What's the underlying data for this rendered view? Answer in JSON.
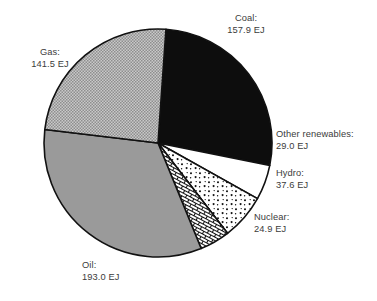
{
  "chart_data": {
    "type": "pie",
    "title": "",
    "unit": "EJ",
    "total": 583.9,
    "start_angle_deg": -86,
    "direction": "clockwise",
    "categories": [
      "Coal",
      "Other renewables",
      "Hydro",
      "Nuclear",
      "Oil",
      "Gas"
    ],
    "values": [
      157.9,
      29.0,
      37.6,
      24.9,
      193.0,
      141.5
    ],
    "slices": [
      {
        "label": "Coal:",
        "value_text": "157.9 EJ",
        "value": 157.9,
        "fill_style": "solid-black",
        "color": "#0d0d0d"
      },
      {
        "label": "Other renewables:",
        "value_text": "29.0 EJ",
        "value": 29.0,
        "fill_style": "solid-white",
        "color": "#ffffff"
      },
      {
        "label": "Hydro:",
        "value_text": "37.6 EJ",
        "value": 37.6,
        "fill_style": "sparse-dots",
        "color": "#ffffff"
      },
      {
        "label": "Nuclear:",
        "value_text": "24.9 EJ",
        "value": 24.9,
        "fill_style": "brick-hatch",
        "color": "#ffffff"
      },
      {
        "label": "Oil:",
        "value_text": "193.0 EJ",
        "value": 193.0,
        "fill_style": "solid-gray",
        "color": "#9a9a9a"
      },
      {
        "label": "Gas:",
        "value_text": "141.5 EJ",
        "value": 141.5,
        "fill_style": "fine-grid",
        "color": "#b3b3b3"
      }
    ],
    "legend": "none",
    "grid": false,
    "xlabel": "",
    "ylabel": ""
  },
  "geometry": {
    "center_x": 158,
    "center_y": 143,
    "radius": 114
  },
  "labels": {
    "coal": {
      "name": "Coal:",
      "value": "157.9 EJ"
    },
    "gas": {
      "name": "Gas:",
      "value": "141.5 EJ"
    },
    "other": {
      "name": "Other renewables:",
      "value": "29.0 EJ"
    },
    "hydro": {
      "name": "Hydro:",
      "value": "37.6 EJ"
    },
    "nuclear": {
      "name": "Nuclear:",
      "value": "24.9 EJ"
    },
    "oil": {
      "name": "Oil:",
      "value": "193.0 EJ"
    }
  }
}
